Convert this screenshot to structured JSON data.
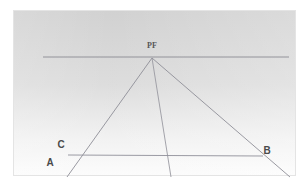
{
  "figure": {
    "kind": "perspective-construction-diagram",
    "background_color": "#ffffff",
    "panel": {
      "fill_top_color": "#d2d2d2",
      "fill_bottom_color": "#fbfbfb",
      "border_color": "#e2e2e2",
      "x": 13,
      "y": 10,
      "width": 283,
      "height": 166
    },
    "line_color": "#8e8e96",
    "label_color": "#4a4a4a"
  },
  "labels": {
    "vanishing_point": "PF",
    "point_a": "A",
    "point_b": "B",
    "point_c": "C"
  },
  "label_positions": {
    "vanishing_point": {
      "x": 152,
      "y": 48
    },
    "point_a": {
      "x": 50,
      "y": 166
    },
    "point_b": {
      "x": 267,
      "y": 154
    },
    "point_c": {
      "x": 61,
      "y": 148
    }
  },
  "geometry": {
    "vanishing_point": {
      "x": 152,
      "y": 58
    },
    "horizon_line": {
      "x1": 43,
      "y1": 57,
      "x2": 289,
      "y2": 57
    },
    "base_line": {
      "x1": 68,
      "y1": 155,
      "x2": 263,
      "y2": 156
    },
    "rays": [
      {
        "name": "ray-to-left",
        "x1": 152,
        "y1": 58,
        "x2": 67,
        "y2": 177
      },
      {
        "name": "ray-center",
        "x1": 152,
        "y1": 58,
        "x2": 171,
        "y2": 177
      },
      {
        "name": "ray-to-right",
        "x1": 152,
        "y1": 58,
        "x2": 290,
        "y2": 177
      }
    ]
  },
  "notes": {
    "horizon_label": "horizon line",
    "vanishing_label": "vanishing point"
  }
}
